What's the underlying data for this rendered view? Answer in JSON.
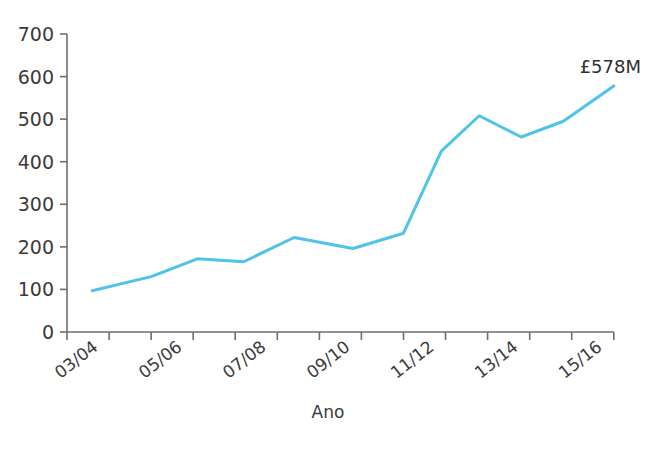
{
  "chart_data": {
    "type": "line",
    "title": "",
    "subtitle": "",
    "xlabel": "Ano",
    "ylabel": "",
    "ylim": [
      0,
      700
    ],
    "y_ticks": [
      0,
      100,
      200,
      300,
      400,
      500,
      600,
      700
    ],
    "x_tick_labels": [
      "03/04",
      "05/06",
      "07/08",
      "09/10",
      "11/12",
      "13/14",
      "15/16"
    ],
    "grid": false,
    "legend": false,
    "legend_position": "none",
    "annotations": [
      {
        "text": "£578M",
        "attached_to_point_index": 11
      }
    ],
    "series": [
      {
        "name": "",
        "color": "#4FC3E8",
        "line_width": 3,
        "categories": [
          "03/04",
          "04/05",
          "05/06",
          "06/07",
          "07/08",
          "08/09",
          "09/10",
          "10/11",
          "11/12",
          "12/13",
          "13/14",
          "14/15",
          "15/16",
          "16/17"
        ],
        "x": [
          0.6,
          2,
          3.1,
          4.2,
          5.4,
          6.8,
          8.0,
          8.9,
          9.8,
          10.8,
          11.8,
          13.0
        ],
        "values": [
          97,
          130,
          172,
          165,
          222,
          196,
          232,
          425,
          508,
          458,
          495,
          578
        ]
      }
    ]
  },
  "axis": {
    "y_axis_name": "y-axis",
    "x_axis_name": "x-axis"
  }
}
